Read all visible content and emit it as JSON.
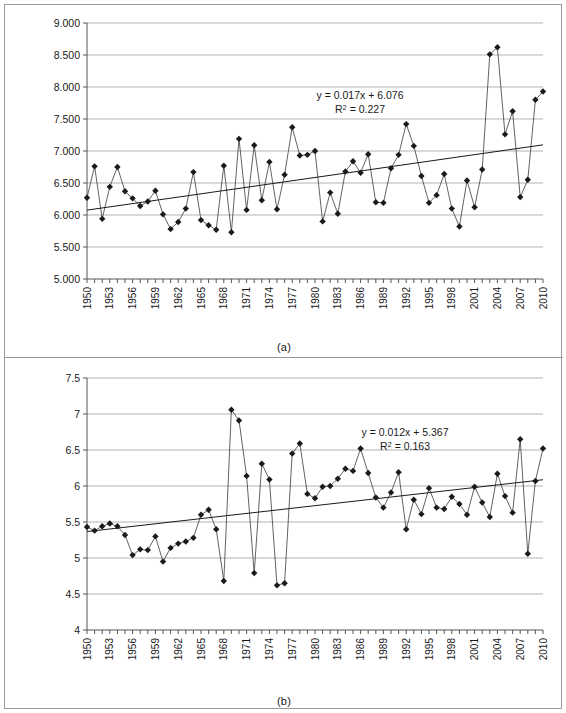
{
  "figure": {
    "panel_a_label": "(a)",
    "panel_b_label": "(b)",
    "border_color": "#9a9a9a",
    "series_color": "#1a1a1a",
    "trend_color": "#1a1a1a",
    "grid_color": "#b3b3b3"
  },
  "chart_data": [
    {
      "type": "line",
      "panel": "(a)",
      "title": "",
      "xlabel": "",
      "ylabel": "",
      "xlim": [
        1950,
        2010
      ],
      "ylim": [
        5.0,
        9.0
      ],
      "grid": true,
      "legend": "none",
      "marker": "diamond",
      "ytick_labels": [
        "9.000",
        "8.500",
        "8.000",
        "7.500",
        "7.000",
        "6.500",
        "6.000",
        "5.500",
        "5.000"
      ],
      "ytick_values": [
        9.0,
        8.5,
        8.0,
        7.5,
        7.0,
        6.5,
        6.0,
        5.5,
        5.0
      ],
      "xtick_labels": [
        "1950",
        "1953",
        "1956",
        "1959",
        "1962",
        "1965",
        "1968",
        "1971",
        "1974",
        "1977",
        "1980",
        "1983",
        "1986",
        "1989",
        "1992",
        "1995",
        "1998",
        "2001",
        "2004",
        "2007",
        "2010"
      ],
      "xtick_values": [
        1950,
        1953,
        1956,
        1959,
        1962,
        1965,
        1968,
        1971,
        1974,
        1977,
        1980,
        1983,
        1986,
        1989,
        1992,
        1995,
        1998,
        2001,
        2004,
        2007,
        2010
      ],
      "annotation_equation": "y = 0.017x + 6.076",
      "annotation_r2_prefix": "R",
      "annotation_r2_sup": "2",
      "annotation_r2_value": " = 0.227",
      "trendline": {
        "slope": 0.017,
        "intercept": 6.076,
        "r2": 0.227,
        "y_start": 6.076,
        "y_end": 7.096
      },
      "x": [
        1950,
        1951,
        1952,
        1953,
        1954,
        1955,
        1956,
        1957,
        1958,
        1959,
        1960,
        1961,
        1962,
        1963,
        1964,
        1965,
        1966,
        1967,
        1968,
        1969,
        1970,
        1971,
        1972,
        1973,
        1974,
        1975,
        1976,
        1977,
        1978,
        1979,
        1980,
        1981,
        1982,
        1983,
        1984,
        1985,
        1986,
        1987,
        1988,
        1989,
        1990,
        1991,
        1992,
        1993,
        1994,
        1995,
        1996,
        1997,
        1998,
        1999,
        2000,
        2001,
        2002,
        2003,
        2004,
        2005,
        2006,
        2007,
        2008,
        2009,
        2010
      ],
      "values": [
        6.27,
        6.76,
        5.94,
        6.44,
        6.75,
        6.37,
        6.26,
        6.14,
        6.21,
        6.38,
        6.01,
        5.78,
        5.89,
        6.1,
        6.67,
        5.92,
        5.84,
        5.77,
        6.77,
        5.73,
        7.19,
        6.08,
        7.09,
        6.23,
        6.83,
        6.09,
        6.63,
        7.37,
        6.93,
        6.94,
        7.0,
        5.9,
        6.35,
        6.02,
        6.68,
        6.84,
        6.66,
        6.95,
        6.2,
        6.19,
        6.73,
        6.94,
        7.42,
        7.08,
        6.61,
        6.19,
        6.31,
        6.64,
        6.1,
        5.82,
        6.54,
        6.12,
        6.71,
        8.51,
        8.62,
        7.26,
        7.62,
        6.28,
        6.55,
        7.8,
        7.93
      ]
    },
    {
      "type": "line",
      "panel": "(b)",
      "title": "",
      "xlabel": "",
      "ylabel": "",
      "xlim": [
        1950,
        2010
      ],
      "ylim": [
        4.0,
        7.5
      ],
      "grid": true,
      "legend": "none",
      "marker": "diamond",
      "ytick_labels": [
        "7.5",
        "7",
        "6.5",
        "6",
        "5.5",
        "5",
        "4.5",
        "4"
      ],
      "ytick_values": [
        7.5,
        7.0,
        6.5,
        6.0,
        5.5,
        5.0,
        4.5,
        4.0
      ],
      "xtick_labels": [
        "1950",
        "1953",
        "1956",
        "1959",
        "1962",
        "1965",
        "1968",
        "1971",
        "1974",
        "1977",
        "1980",
        "1983",
        "1986",
        "1989",
        "1992",
        "1995",
        "1998",
        "2001",
        "2004",
        "2007",
        "2010"
      ],
      "xtick_values": [
        1950,
        1953,
        1956,
        1959,
        1962,
        1965,
        1968,
        1971,
        1974,
        1977,
        1980,
        1983,
        1986,
        1989,
        1992,
        1995,
        1998,
        2001,
        2004,
        2007,
        2010
      ],
      "annotation_equation": "y = 0.012x + 5.367",
      "annotation_r2_prefix": "R",
      "annotation_r2_sup": "2",
      "annotation_r2_value": " = 0.163",
      "trendline": {
        "slope": 0.012,
        "intercept": 5.367,
        "r2": 0.163,
        "y_start": 5.367,
        "y_end": 6.087
      },
      "x": [
        1950,
        1951,
        1952,
        1953,
        1954,
        1955,
        1956,
        1957,
        1958,
        1959,
        1960,
        1961,
        1962,
        1963,
        1964,
        1965,
        1966,
        1967,
        1968,
        1969,
        1970,
        1971,
        1972,
        1973,
        1974,
        1975,
        1976,
        1977,
        1978,
        1979,
        1980,
        1981,
        1982,
        1983,
        1984,
        1985,
        1986,
        1987,
        1988,
        1989,
        1990,
        1991,
        1992,
        1993,
        1994,
        1995,
        1996,
        1997,
        1998,
        1999,
        2000,
        2001,
        2002,
        2003,
        2004,
        2005,
        2006,
        2007,
        2008,
        2009,
        2010
      ],
      "values": [
        5.43,
        5.38,
        5.44,
        5.48,
        5.44,
        5.32,
        5.04,
        5.12,
        5.11,
        5.3,
        4.95,
        5.14,
        5.2,
        5.23,
        5.28,
        5.6,
        5.67,
        5.4,
        4.68,
        7.06,
        6.91,
        6.14,
        4.79,
        6.31,
        6.09,
        4.62,
        4.65,
        6.45,
        6.59,
        5.89,
        5.83,
        5.99,
        6.0,
        6.1,
        6.24,
        6.21,
        6.52,
        6.18,
        5.84,
        5.7,
        5.91,
        6.19,
        5.4,
        5.81,
        5.61,
        5.97,
        5.7,
        5.68,
        5.85,
        5.75,
        5.6,
        5.99,
        5.77,
        5.57,
        6.17,
        5.86,
        5.63,
        6.65,
        5.06,
        6.07,
        6.52,
        6.29
      ]
    }
  ]
}
